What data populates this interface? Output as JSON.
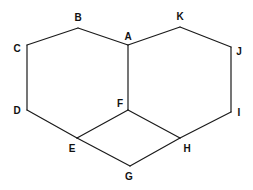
{
  "figure": {
    "type": "line-diagram",
    "width": 253,
    "height": 190,
    "background_color": "#ffffff",
    "stroke_color": "#1a1a1a",
    "label_color": "#111111",
    "stroke_width": 1.2
  },
  "vertices": [
    {
      "id": "A",
      "label": "A",
      "x": 128,
      "y": 45,
      "label_x": 128,
      "label_y": 37,
      "label_anchor": "middle"
    },
    {
      "id": "B",
      "label": "B",
      "x": 78,
      "y": 28,
      "label_x": 78,
      "label_y": 18,
      "label_anchor": "middle"
    },
    {
      "id": "C",
      "label": "C",
      "x": 27,
      "y": 45,
      "label_x": 17,
      "label_y": 49,
      "label_anchor": "middle"
    },
    {
      "id": "D",
      "label": "D",
      "x": 27,
      "y": 110,
      "label_x": 17,
      "label_y": 111,
      "label_anchor": "middle"
    },
    {
      "id": "E",
      "label": "E",
      "x": 77,
      "y": 138,
      "label_x": 72,
      "label_y": 149,
      "label_anchor": "middle"
    },
    {
      "id": "F",
      "label": "F",
      "x": 128,
      "y": 110,
      "label_x": 120,
      "label_y": 104,
      "label_anchor": "middle"
    },
    {
      "id": "G",
      "label": "G",
      "x": 130,
      "y": 166,
      "label_x": 129,
      "label_y": 177,
      "label_anchor": "middle"
    },
    {
      "id": "H",
      "label": "H",
      "x": 180,
      "y": 138,
      "label_x": 187,
      "label_y": 149,
      "label_anchor": "middle"
    },
    {
      "id": "I",
      "label": "I",
      "x": 231,
      "y": 112,
      "label_x": 239,
      "label_y": 113,
      "label_anchor": "middle"
    },
    {
      "id": "J",
      "label": "J",
      "x": 231,
      "y": 47,
      "label_x": 239,
      "label_y": 52,
      "label_anchor": "middle"
    },
    {
      "id": "K",
      "label": "K",
      "x": 180,
      "y": 27,
      "label_x": 180,
      "label_y": 17,
      "label_anchor": "middle"
    }
  ],
  "edges": [
    {
      "from": "A",
      "to": "B",
      "x1": 128,
      "y1": 45,
      "x2": 78,
      "y2": 28
    },
    {
      "from": "B",
      "to": "C",
      "x1": 78,
      "y1": 28,
      "x2": 27,
      "y2": 45
    },
    {
      "from": "C",
      "to": "D",
      "x1": 27,
      "y1": 45,
      "x2": 27,
      "y2": 110
    },
    {
      "from": "D",
      "to": "E",
      "x1": 27,
      "y1": 110,
      "x2": 77,
      "y2": 138
    },
    {
      "from": "E",
      "to": "F",
      "x1": 77,
      "y1": 138,
      "x2": 128,
      "y2": 110
    },
    {
      "from": "F",
      "to": "A",
      "x1": 128,
      "y1": 110,
      "x2": 128,
      "y2": 45
    },
    {
      "from": "A",
      "to": "K",
      "x1": 128,
      "y1": 45,
      "x2": 180,
      "y2": 27
    },
    {
      "from": "K",
      "to": "J",
      "x1": 180,
      "y1": 27,
      "x2": 231,
      "y2": 47
    },
    {
      "from": "J",
      "to": "I",
      "x1": 231,
      "y1": 47,
      "x2": 231,
      "y2": 112
    },
    {
      "from": "I",
      "to": "H",
      "x1": 231,
      "y1": 112,
      "x2": 180,
      "y2": 138
    },
    {
      "from": "H",
      "to": "F",
      "x1": 180,
      "y1": 138,
      "x2": 128,
      "y2": 110
    },
    {
      "from": "E",
      "to": "G",
      "x1": 77,
      "y1": 138,
      "x2": 130,
      "y2": 166
    },
    {
      "from": "G",
      "to": "H",
      "x1": 130,
      "y1": 166,
      "x2": 180,
      "y2": 138
    }
  ]
}
